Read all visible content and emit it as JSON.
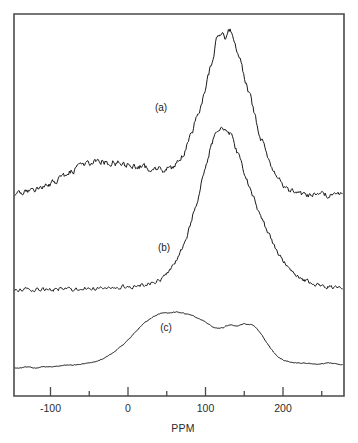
{
  "figure": {
    "type": "nmr-spectra-stack",
    "background_color": "#ffffff",
    "frame_color": "#4a4a4a",
    "trace_color": "#1a1a1a"
  },
  "chart_data": {
    "type": "line",
    "title": "",
    "subtitle": "",
    "xlabel": "PPM",
    "ylabel": "",
    "xlim": [
      -150,
      280
    ],
    "grid": false,
    "legend_position": "inline-annotations",
    "axis": {
      "major_ticks": [
        -100,
        0,
        100,
        200
      ],
      "major_tick_labels": [
        "-100",
        "0",
        "100",
        "200"
      ],
      "minor_ticks": [
        -150,
        -50,
        50,
        150,
        250
      ],
      "tick_direction": "up",
      "frame_sides": [
        "left",
        "top",
        "right",
        "bottom"
      ]
    },
    "annotations": [
      {
        "text": "(a)",
        "x_ppm": 40,
        "trace": "a"
      },
      {
        "text": "(b)",
        "x_ppm": 44,
        "trace": "b"
      },
      {
        "text": "(c)",
        "x_ppm": 47,
        "trace": "c"
      }
    ],
    "series": [
      {
        "name": "(a)",
        "label": "(a)",
        "style": "noisy",
        "noise_amplitude": 5.5,
        "description": "Broad underlying hump near -60 to 20 ppm with sharp dominant peak near 130 ppm",
        "baseline_y_px": 196,
        "peak_ppm": 130,
        "peak_height_px": 166,
        "x": [
          -150,
          -140,
          -130,
          -120,
          -110,
          -100,
          -90,
          -80,
          -70,
          -60,
          -50,
          -40,
          -30,
          -20,
          -10,
          0,
          10,
          20,
          30,
          40,
          50,
          60,
          70,
          80,
          90,
          100,
          110,
          115,
          120,
          125,
          130,
          135,
          140,
          145,
          150,
          160,
          170,
          180,
          190,
          200,
          210,
          220,
          230,
          240,
          250,
          260,
          270,
          280
        ],
        "y": [
          0,
          2,
          4,
          6,
          9,
          12,
          16,
          21,
          26,
          30,
          33,
          34,
          34,
          33,
          32,
          31,
          30,
          29,
          28,
          27,
          27,
          30,
          40,
          58,
          82,
          108,
          140,
          156,
          162,
          160,
          166,
          158,
          148,
          136,
          120,
          92,
          62,
          40,
          24,
          12,
          5,
          2,
          1,
          1,
          2,
          1,
          2,
          3
        ]
      },
      {
        "name": "(b)",
        "label": "(b)",
        "style": "noisy",
        "noise_amplitude": 4.0,
        "description": "Single broad symmetric peak centered near 125 ppm on a flat noisy baseline",
        "baseline_y_px": 290,
        "peak_ppm": 125,
        "peak_height_px": 162,
        "x": [
          -150,
          -140,
          -130,
          -120,
          -110,
          -100,
          -90,
          -80,
          -70,
          -60,
          -50,
          -40,
          -30,
          -20,
          -10,
          0,
          10,
          20,
          30,
          40,
          50,
          60,
          70,
          80,
          90,
          100,
          110,
          120,
          125,
          130,
          140,
          150,
          160,
          170,
          180,
          190,
          200,
          210,
          220,
          230,
          240,
          250,
          260,
          270,
          280
        ],
        "y": [
          0,
          0,
          1,
          0,
          1,
          0,
          1,
          1,
          0,
          1,
          2,
          1,
          2,
          2,
          3,
          3,
          4,
          5,
          7,
          10,
          16,
          26,
          42,
          64,
          92,
          122,
          150,
          160,
          162,
          158,
          140,
          118,
          96,
          76,
          58,
          42,
          30,
          20,
          13,
          9,
          6,
          4,
          3,
          2,
          2
        ]
      },
      {
        "name": "(c)",
        "label": "(c)",
        "style": "smooth",
        "noise_amplitude": 0.8,
        "description": "Very broad smooth band from -40 to 180 ppm with plateau near 20-60 ppm and shoulder near 150 ppm",
        "baseline_y_px": 370,
        "peak_ppm": 30,
        "peak_height_px": 58,
        "x": [
          -150,
          -140,
          -130,
          -120,
          -110,
          -100,
          -90,
          -80,
          -70,
          -60,
          -50,
          -40,
          -30,
          -20,
          -10,
          0,
          10,
          20,
          30,
          40,
          50,
          60,
          70,
          80,
          90,
          100,
          110,
          120,
          130,
          140,
          150,
          160,
          170,
          180,
          190,
          200,
          210,
          220,
          230,
          240,
          250,
          260,
          270,
          280
        ],
        "y": [
          2,
          2,
          3,
          2,
          3,
          3,
          4,
          5,
          5,
          6,
          7,
          9,
          12,
          17,
          23,
          30,
          38,
          46,
          52,
          56,
          57,
          58,
          57,
          55,
          52,
          48,
          43,
          42,
          45,
          44,
          46,
          45,
          38,
          26,
          16,
          10,
          8,
          7,
          7,
          6,
          6,
          7,
          6,
          5
        ]
      }
    ]
  }
}
